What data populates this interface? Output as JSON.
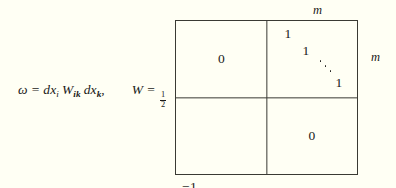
{
  "figure": {
    "equation": {
      "omega": "ω",
      "equals": "=",
      "dx_first": "dx",
      "sub_i": "i",
      "w_symbol": "W",
      "sub_ik": "ik",
      "dx_second": "dx",
      "sub_k": "k",
      "comma": ",",
      "w_label": "W",
      "w_equals": "=",
      "fraction_numerator": "1",
      "fraction_denominator": "2"
    },
    "matrix": {
      "top_left_block": "0",
      "bottom_right_block": "0",
      "top_right_block": {
        "entry_1": "1",
        "entry_2": "1",
        "ellipsis": "ddots-icon",
        "entry_3": "1"
      },
      "bottom_left_block": {
        "entry_1": "−1",
        "entry_2": "−1",
        "ellipsis": "ddots-icon",
        "entry_3": "−1"
      }
    },
    "labels": {
      "dimension_top": "m",
      "dimension_right": "m"
    }
  }
}
